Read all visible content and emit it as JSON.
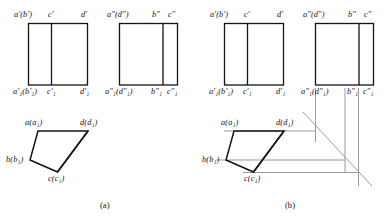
{
  "figure": {
    "title_parts": [
      "(a)",
      "(b)"
    ],
    "background_color": "#ffffff",
    "solid_line_color": "#141414",
    "construction_line_color": "#9a9a9a"
  },
  "captions": {
    "a": "(a)",
    "b": "(b)"
  },
  "group_a": {
    "front_view": {
      "name": "front-view-rectangle",
      "labels_top": {
        "left": "a′(b′)",
        "middle": "c′",
        "right": "d′"
      },
      "labels_bottom": {
        "left": "a′₁(b′₁)",
        "middle": "c′₁",
        "right": "d′₁"
      }
    },
    "side_view": {
      "name": "side-view-rectangle",
      "labels_top": {
        "left": "a″(d″)",
        "middle": "b″",
        "right": "c″"
      },
      "labels_bottom": {
        "left": "a″₁(d″₁)",
        "middle": "b″₁",
        "right": "c″₁"
      }
    },
    "top_view": {
      "name": "top-view-quadrilateral",
      "vertices": {
        "a": "a(a₁)",
        "d": "d(d₁)",
        "b": "b(b₁)",
        "c": "c(c₁)"
      }
    }
  },
  "group_b": {
    "front_view": {
      "name": "front-view-rectangle",
      "labels_top": {
        "left": "a′(b′)",
        "middle": "c′",
        "right": "d′"
      },
      "labels_bottom": {
        "left": "a′₁(b′₁)",
        "middle": "c′₁",
        "right": "d′₁"
      }
    },
    "side_view": {
      "name": "side-view-rectangle",
      "labels_top": {
        "left": "a″(d″)",
        "middle": "b″",
        "right": "c″"
      },
      "labels_bottom": {
        "left": "a″₁(d″₁)",
        "middle": "b″₁",
        "right": "c″₁"
      }
    },
    "top_view": {
      "name": "top-view-quadrilateral",
      "vertices": {
        "a": "a(a₁)",
        "d": "d(d₁)",
        "b": "b(b₁)",
        "c": "c(c₁)"
      }
    },
    "construction": {
      "name": "projection-construction-lines",
      "has_miter_line": true,
      "miter_angle_deg": 45
    }
  }
}
